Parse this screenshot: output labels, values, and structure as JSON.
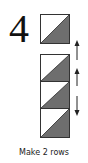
{
  "step": {
    "number": "4",
    "caption": "Make 2 rows"
  },
  "colors": {
    "triangle_fill": "#6e6e6e",
    "square_fill": "#ffffff",
    "outline": "#333333"
  },
  "single_block": {
    "type": "half-square-triangle",
    "shaded_half": "bottom-right"
  },
  "column": {
    "block_count": 3,
    "blocks": [
      {
        "type": "half-square-triangle",
        "shaded_half": "bottom-right"
      },
      {
        "type": "half-square-triangle",
        "shaded_half": "bottom-right"
      },
      {
        "type": "half-square-triangle",
        "shaded_half": "bottom-right"
      }
    ],
    "arrows": [
      {
        "direction": "up"
      },
      {
        "direction": "up"
      },
      {
        "direction": "down"
      }
    ]
  }
}
